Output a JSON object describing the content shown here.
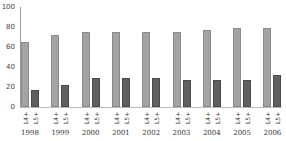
{
  "chart_data": {
    "type": "bar",
    "title": "",
    "xlabel": "",
    "ylabel": "",
    "ylim": [
      0,
      100
    ],
    "yticks": [
      0,
      20,
      40,
      60,
      80,
      100
    ],
    "categories": [
      "1998",
      "1999",
      "2000",
      "2001",
      "2002",
      "2003",
      "2004",
      "2005",
      "2006"
    ],
    "series": [
      {
        "name": "L4+",
        "color": "#a3a3a3",
        "values": [
          65,
          72,
          75,
          75,
          75,
          75,
          77,
          79,
          79
        ]
      },
      {
        "name": "L5+",
        "color": "#606060",
        "values": [
          17,
          22,
          29,
          29,
          29,
          27,
          27,
          27,
          32
        ]
      }
    ],
    "grid": false,
    "legend": "none; series labels shown rotated under each bar"
  },
  "labels": {
    "yticks": [
      "0",
      "20",
      "40",
      "60",
      "80",
      "100"
    ],
    "series_short": [
      "L4+",
      "L5+"
    ]
  }
}
